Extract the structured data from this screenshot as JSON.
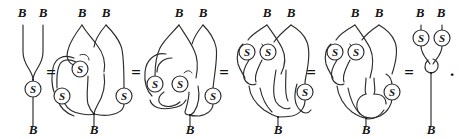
{
  "figure": {
    "kind": "string-diagram-equation-chain",
    "endpoint_label": "B",
    "node_label": "S",
    "equals_sign": "=",
    "period": ".",
    "stroke_color": "#2b2b2b",
    "text_color": "#141414",
    "background": "#ffffff",
    "relations": [
      {
        "id": "rel-1",
        "x": 51,
        "y": 73,
        "text": "="
      },
      {
        "id": "rel-2",
        "x": 136,
        "y": 73,
        "text": "="
      },
      {
        "id": "rel-3",
        "x": 224,
        "y": 73,
        "text": "="
      },
      {
        "id": "rel-4",
        "x": 311,
        "y": 73,
        "text": "="
      },
      {
        "id": "rel-5",
        "x": 399,
        "y": 73,
        "text": "="
      }
    ],
    "terminal_period": {
      "x": 451,
      "y": 72,
      "text": "."
    },
    "diagrams": [
      {
        "id": "diagram-1",
        "name": "antipode-of-product",
        "s_node_count": 1,
        "top_labels": [
          {
            "text": "B",
            "x": 22,
            "y": 17
          },
          {
            "text": "B",
            "x": 41,
            "y": 17
          }
        ],
        "bottom_labels": [
          {
            "text": "B",
            "x": 32,
            "y": 133
          }
        ],
        "s_nodes": [
          {
            "text": "S",
            "cx": 33,
            "cy": 89,
            "r": 8
          }
        ]
      },
      {
        "id": "diagram-2",
        "name": "tangle-step-1",
        "s_node_count": 3,
        "top_labels": [
          {
            "text": "B",
            "x": 82,
            "y": 17
          },
          {
            "text": "B",
            "x": 106,
            "y": 17
          }
        ],
        "bottom_labels": [
          {
            "text": "B",
            "x": 94,
            "y": 133
          }
        ],
        "s_nodes": [
          {
            "text": "S",
            "cx": 80,
            "cy": 69,
            "r": 8
          },
          {
            "text": "S",
            "cx": 65,
            "cy": 96,
            "r": 8
          },
          {
            "text": "S",
            "cx": 124,
            "cy": 96,
            "r": 8
          }
        ]
      },
      {
        "id": "diagram-3",
        "name": "tangle-step-2",
        "s_node_count": 3,
        "top_labels": [
          {
            "text": "B",
            "x": 179,
            "y": 17
          },
          {
            "text": "B",
            "x": 203,
            "y": 17
          }
        ],
        "bottom_labels": [
          {
            "text": "B",
            "x": 190,
            "y": 133
          }
        ],
        "s_nodes": [
          {
            "text": "S",
            "cx": 156,
            "cy": 84,
            "r": 8
          },
          {
            "text": "S",
            "cx": 181,
            "cy": 84,
            "r": 8
          },
          {
            "text": "S",
            "cx": 213,
            "cy": 96,
            "r": 8
          }
        ]
      },
      {
        "id": "diagram-4",
        "name": "tangle-step-3",
        "s_node_count": 3,
        "top_labels": [
          {
            "text": "B",
            "x": 267,
            "y": 17
          },
          {
            "text": "B",
            "x": 291,
            "y": 17
          }
        ],
        "bottom_labels": [
          {
            "text": "B",
            "x": 278,
            "y": 133
          }
        ],
        "s_nodes": [
          {
            "text": "S",
            "cx": 249,
            "cy": 52,
            "r": 8
          },
          {
            "text": "S",
            "cx": 270,
            "cy": 52,
            "r": 8
          },
          {
            "text": "S",
            "cx": 305,
            "cy": 92,
            "r": 8
          }
        ]
      },
      {
        "id": "diagram-5",
        "name": "tangle-step-4",
        "s_node_count": 3,
        "top_labels": [
          {
            "text": "B",
            "x": 355,
            "y": 17
          },
          {
            "text": "B",
            "x": 379,
            "y": 17
          }
        ],
        "bottom_labels": [
          {
            "text": "B",
            "x": 366,
            "y": 133
          }
        ],
        "s_nodes": [
          {
            "text": "S",
            "cx": 337,
            "cy": 52,
            "r": 8
          },
          {
            "text": "S",
            "cx": 358,
            "cy": 52,
            "r": 8
          },
          {
            "text": "S",
            "cx": 392,
            "cy": 92,
            "r": 8
          }
        ]
      },
      {
        "id": "diagram-6",
        "name": "product-of-antipodes-opposite",
        "s_node_count": 2,
        "top_labels": [
          {
            "text": "B",
            "x": 420,
            "y": 17
          },
          {
            "text": "B",
            "x": 441,
            "y": 17
          }
        ],
        "bottom_labels": [
          {
            "text": "B",
            "x": 430,
            "y": 133
          }
        ],
        "s_nodes": [
          {
            "text": "S",
            "cx": 421,
            "cy": 38,
            "r": 8
          },
          {
            "text": "S",
            "cx": 442,
            "cy": 38,
            "r": 8
          }
        ]
      }
    ]
  }
}
